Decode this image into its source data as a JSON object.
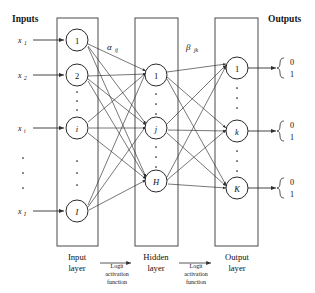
{
  "figure": {
    "type": "neural-network-diagram",
    "headers": {
      "inputs": "Inputs",
      "outputs": "Outputs"
    },
    "input_signals": [
      {
        "base": "x",
        "sub": "1",
        "y": 40
      },
      {
        "base": "x",
        "sub": "2",
        "y": 75
      },
      {
        "base": "x",
        "sub": "i",
        "y": 128
      },
      {
        "base": "x",
        "sub": "I",
        "y": 211
      }
    ],
    "layers": [
      {
        "id": "input-layer",
        "caption_line1": "Input",
        "caption_line2": "layer",
        "box": {
          "x": 57,
          "y": 18,
          "w": 41,
          "h": 228
        },
        "nodes": [
          {
            "label": "1",
            "italic": false,
            "y": 40
          },
          {
            "label": "2",
            "italic": false,
            "y": 75
          },
          {
            "label": "i",
            "italic": true,
            "y": 128
          },
          {
            "label": "I",
            "italic": true,
            "y": 211
          }
        ],
        "gap_dots": [
          {
            "y_positions": [
              92,
              101,
              110
            ]
          },
          {
            "y_positions": [
              160,
              172,
              184
            ]
          }
        ]
      },
      {
        "id": "hidden-layer",
        "caption_line1": "Hidden",
        "caption_line2": "layer",
        "box": {
          "x": 135,
          "y": 18,
          "w": 43,
          "h": 228
        },
        "nodes": [
          {
            "label": "1",
            "italic": false,
            "y": 75
          },
          {
            "label": "j",
            "italic": true,
            "y": 128
          },
          {
            "label": "H",
            "italic": true,
            "y": 181
          }
        ],
        "gap_dots": [
          {
            "y_positions": [
              94,
              104,
              114
            ]
          },
          {
            "y_positions": [
              147,
              157,
              167
            ]
          }
        ]
      },
      {
        "id": "output-layer",
        "caption_line1": "Output",
        "caption_line2": "layer",
        "box": {
          "x": 215,
          "y": 18,
          "w": 43,
          "h": 228
        },
        "nodes": [
          {
            "label": "1",
            "italic": false,
            "y": 68
          },
          {
            "label": "k",
            "italic": true,
            "y": 131
          },
          {
            "label": "K",
            "italic": true,
            "y": 188
          }
        ],
        "gap_dots": [
          {
            "y_positions": [
              88,
              98,
              108
            ]
          },
          {
            "y_positions": [
              150,
              160,
              170
            ]
          }
        ]
      }
    ],
    "weight_labels": [
      {
        "id": "alpha",
        "glyph": "α",
        "sub": "ij",
        "x": 107,
        "y": 47
      },
      {
        "id": "beta",
        "glyph": "β",
        "sub": "jk",
        "x": 186,
        "y": 47
      }
    ],
    "transition_captions": [
      {
        "id": "input-to-hidden",
        "line1": "Logit",
        "line2": "activation",
        "line3": "function",
        "x": 117,
        "arrow_from_x": 100,
        "arrow_to_x": 133,
        "arrow_y": 259
      },
      {
        "id": "hidden-to-output",
        "line1": "Logit",
        "line2": "activation",
        "line3": "function",
        "x": 196,
        "arrow_from_x": 179,
        "arrow_to_x": 212,
        "arrow_y": 259
      }
    ],
    "outputs": [
      {
        "y": 68,
        "bits": [
          "0",
          "1"
        ]
      },
      {
        "y": 131,
        "bits": [
          "0",
          "1"
        ]
      },
      {
        "y": 188,
        "bits": [
          "0",
          "1"
        ]
      }
    ]
  }
}
